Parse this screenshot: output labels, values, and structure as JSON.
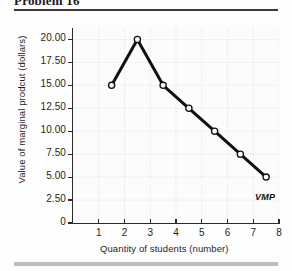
{
  "figure": {
    "title": "Problem 16",
    "annotation_label": "VMP"
  },
  "chart_data": {
    "type": "line",
    "title": "Problem 16",
    "xlabel": "Quantity of students (number)",
    "ylabel": "Value of marginal prodcut (dollars)",
    "xlim": [
      0,
      8
    ],
    "ylim": [
      0,
      21.25
    ],
    "grid": true,
    "legend": "none",
    "series_label": "VMP",
    "x": [
      1.5,
      2.5,
      3.5,
      4.5,
      5.5,
      6.5,
      7.5
    ],
    "values": [
      15.0,
      20.0,
      15.0,
      12.5,
      10.0,
      7.5,
      5.0
    ],
    "points": [
      {
        "x": 1.5,
        "y": 15.0
      },
      {
        "x": 2.5,
        "y": 20.0
      },
      {
        "x": 3.5,
        "y": 15.0
      },
      {
        "x": 4.5,
        "y": 12.5
      },
      {
        "x": 5.5,
        "y": 10.0
      },
      {
        "x": 6.5,
        "y": 7.5
      },
      {
        "x": 7.5,
        "y": 5.0
      }
    ],
    "ytick_values": [
      0,
      2.5,
      5.0,
      7.5,
      10.0,
      12.5,
      15.0,
      17.5,
      20.0
    ],
    "ytick_labels": [
      "0",
      "2.50",
      "5.00",
      "7.50",
      "10.00",
      "12.50",
      "15.00",
      "17.50",
      "20.00"
    ],
    "xtick_values": [
      1,
      2,
      3,
      4,
      5,
      6,
      7,
      8
    ],
    "xtick_labels": [
      "1",
      "2",
      "3",
      "4",
      "5",
      "6",
      "7",
      "8"
    ],
    "colors": {
      "line": "#111111",
      "marker_fill": "#ffffff",
      "marker_edge": "#111111",
      "grid": "#d8d8d8",
      "axis": "#2b2b2b",
      "text": "#1f1f1f",
      "background": "#fcfcfc",
      "rule_top": "#3a3a3a",
      "rule_bottom": "#bdbdbd"
    }
  }
}
